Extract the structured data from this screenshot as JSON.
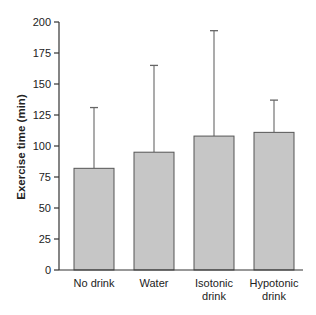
{
  "chart_data": {
    "type": "bar",
    "title": "",
    "xlabel": "",
    "ylabel": "Exercise time (min)",
    "ylim": [
      0,
      200
    ],
    "yticks": [
      0,
      25,
      50,
      75,
      100,
      125,
      150,
      175,
      200
    ],
    "grid": false,
    "legend": null,
    "categories": [
      [
        "No drink"
      ],
      [
        "Water"
      ],
      [
        "Isotonic",
        "drink"
      ],
      [
        "Hypotonic",
        "drink"
      ]
    ],
    "category_labels": [
      "No drink",
      "Water",
      "Isotonic drink",
      "Hypotonic drink"
    ],
    "values": [
      82,
      95,
      108,
      111
    ],
    "error_upper": [
      131,
      165,
      193,
      137
    ],
    "error_bars": "upper-only",
    "colors": {
      "bar_fill": "#c6c6c6",
      "bar_stroke": "#555555",
      "axis": "#333333",
      "error": "#666666"
    }
  }
}
